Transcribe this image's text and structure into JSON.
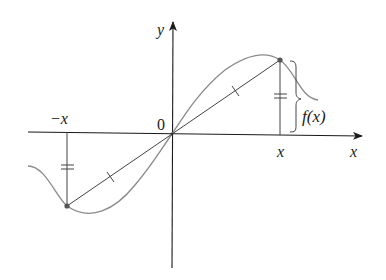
{
  "diagram": {
    "labels": {
      "y_axis": "y",
      "x_axis": "x",
      "origin": "0",
      "neg_x": "−x",
      "pos_x": "x",
      "f_of_x": "f(x)"
    },
    "colors": {
      "axis": "#1a1a1a",
      "curve": "#8a8a8a",
      "segment": "#444444",
      "point": "#555555"
    },
    "elements": {
      "curve": "odd function curve passing through origin",
      "segment": "line from (−x, f(−x)) through origin to (x, f(x)), with single tick marks showing equal halves",
      "vertical_lines": "vertical segments at x and −x marked with double ticks showing equal length",
      "brace": "curly brace labeled f(x) showing height at x"
    }
  }
}
